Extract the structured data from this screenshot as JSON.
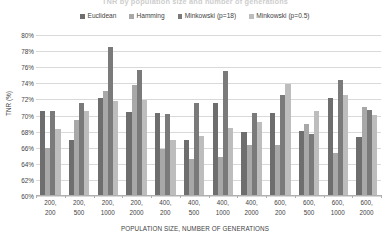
{
  "chart_data": {
    "type": "bar",
    "title": "TNR by population size and number of generations",
    "xlabel": "POPULATION SIZE, NUMBER OF GENERATIONS",
    "ylabel": "TNR (%)",
    "ylim": [
      60,
      80
    ],
    "ytick_step": 2,
    "ytick_labels": [
      "80%",
      "78%",
      "76%",
      "74%",
      "72%",
      "70%",
      "68%",
      "66%",
      "64%",
      "62%",
      "60%"
    ],
    "ytick_values": [
      80,
      78,
      76,
      74,
      72,
      70,
      68,
      66,
      64,
      62,
      60
    ],
    "grid": true,
    "legend_position": "top",
    "categories": [
      "200, 200",
      "200, 500",
      "200, 1000",
      "200, 2000",
      "400, 200",
      "400, 500",
      "400, 1000",
      "400, 2000",
      "600, 200",
      "600, 500",
      "600, 1000",
      "600, 2000"
    ],
    "categories_line1": [
      "200,",
      "200,",
      "200,",
      "200,",
      "400,",
      "400,",
      "400,",
      "400,",
      "600,",
      "600,",
      "600,",
      "600,"
    ],
    "categories_line2": [
      "200",
      "500",
      "1000",
      "2000",
      "200",
      "500",
      "1000",
      "2000",
      "200",
      "500",
      "1000",
      "2000"
    ],
    "series": [
      {
        "name": "Euclidean",
        "color": "#6e6e6e",
        "values": [
          70.6,
          67.0,
          72.2,
          70.4,
          70.3,
          67.0,
          71.6,
          68.0,
          70.3,
          68.1,
          72.2,
          67.3
        ]
      },
      {
        "name": "Hamming",
        "color": "#a8a8a8",
        "values": [
          66.0,
          69.4,
          73.0,
          73.8,
          65.8,
          64.6,
          64.8,
          66.3,
          66.3,
          69.0,
          65.3,
          71.0
        ]
      },
      {
        "name": "Minkowski (p=18)",
        "color": "#7a7a7a",
        "values": [
          70.6,
          71.6,
          78.5,
          75.6,
          70.2,
          71.6,
          75.5,
          70.3,
          72.6,
          67.7,
          74.4,
          70.7
        ]
      },
      {
        "name": "Minkowski (p=0.5)",
        "color": "#bdbdbd",
        "values": [
          68.3,
          70.6,
          71.8,
          71.9,
          67.0,
          67.5,
          68.4,
          69.2,
          73.9,
          70.5,
          72.5,
          70.1
        ]
      }
    ]
  }
}
